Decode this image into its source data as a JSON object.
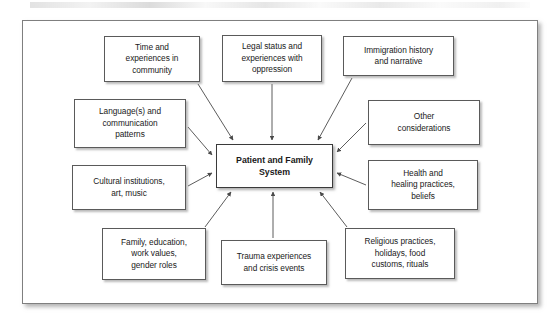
{
  "figure": {
    "type": "hub-and-spoke-concept-diagram",
    "center": {
      "label": "Patient and Family\nSystem",
      "line1": "Patient and Family",
      "line2": "System"
    },
    "nodes": [
      {
        "id": "time",
        "label": "Time and experiences in community",
        "lines": [
          "Time and",
          "experiences in",
          "community"
        ],
        "position": "top-left"
      },
      {
        "id": "legal",
        "label": "Legal status and experiences with oppression",
        "lines": [
          "Legal status and",
          "experiences with",
          "oppression"
        ],
        "position": "top-center"
      },
      {
        "id": "immigration",
        "label": "Immigration history and narrative",
        "lines": [
          "Immigration history",
          "and narrative"
        ],
        "position": "top-right"
      },
      {
        "id": "language",
        "label": "Language(s) and communication patterns",
        "lines": [
          "Language(s) and",
          "communication",
          "patterns"
        ],
        "position": "left-upper"
      },
      {
        "id": "other",
        "label": "Other considerations",
        "lines": [
          "Other",
          "considerations"
        ],
        "position": "right-upper"
      },
      {
        "id": "cultural",
        "label": "Cultural institutions, art, music",
        "lines": [
          "Cultural institutions,",
          "art, music"
        ],
        "position": "left-lower"
      },
      {
        "id": "health",
        "label": "Health and healing practices, beliefs",
        "lines": [
          "Health and",
          "healing practices,",
          "beliefs"
        ],
        "position": "right-lower"
      },
      {
        "id": "family",
        "label": "Family, education, work values, gender roles",
        "lines": [
          "Family, education,",
          "work values,",
          "gender roles"
        ],
        "position": "bottom-left"
      },
      {
        "id": "trauma",
        "label": "Trauma experiences and crisis events",
        "lines": [
          "Trauma experiences",
          "and crisis events"
        ],
        "position": "bottom-center"
      },
      {
        "id": "religious",
        "label": "Religious practices, holidays, food customs, rituals",
        "lines": [
          "Religious practices,",
          "holidays, food",
          "customs, rituals"
        ],
        "position": "bottom-right"
      }
    ],
    "edges": [
      {
        "from": "time",
        "to": "center",
        "arrow": "to-center"
      },
      {
        "from": "legal",
        "to": "center",
        "arrow": "to-center"
      },
      {
        "from": "immigration",
        "to": "center",
        "arrow": "to-center"
      },
      {
        "from": "language",
        "to": "center",
        "arrow": "to-center"
      },
      {
        "from": "other",
        "to": "center",
        "arrow": "to-center"
      },
      {
        "from": "cultural",
        "to": "center",
        "arrow": "to-center"
      },
      {
        "from": "health",
        "to": "center",
        "arrow": "to-center"
      },
      {
        "from": "family",
        "to": "center",
        "arrow": "to-center"
      },
      {
        "from": "trauma",
        "to": "center",
        "arrow": "to-center"
      },
      {
        "from": "religious",
        "to": "center",
        "arrow": "to-center"
      }
    ],
    "colors": {
      "page_background": "#ffffff",
      "frame_border": "#7f7f7f",
      "box_border": "#5a5a5a",
      "box_fill": "#ffffff",
      "text": "#1a1a1a",
      "arrow": "#4a4a4a"
    }
  }
}
